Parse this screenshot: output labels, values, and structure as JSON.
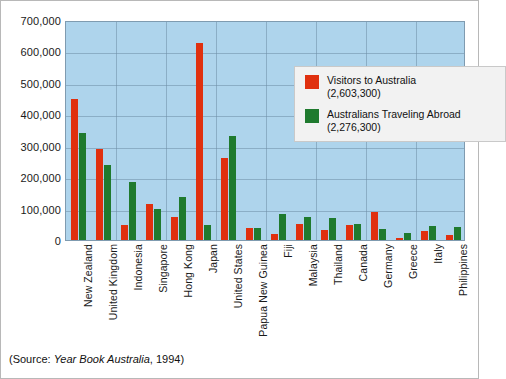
{
  "chart_data": {
    "type": "bar",
    "title": "",
    "xlabel": "",
    "ylabel": "",
    "ylim": [
      0,
      700000
    ],
    "ytick_step": 100000,
    "ytick_labels": [
      "700,000",
      "600,000",
      "500,000",
      "400,000",
      "300,000",
      "200,000",
      "100,000",
      "0"
    ],
    "grid": true,
    "legend_position": "inside-top-right",
    "categories": [
      "New Zealand",
      "United Kingdom",
      "Indonesia",
      "Singapore",
      "Hong Kong",
      "Japan",
      "United States",
      "Papua New Guinea",
      "Fiji",
      "Malaysia",
      "Thailand",
      "Canada",
      "Germany",
      "Greece",
      "Italy",
      "Philippines"
    ],
    "series": [
      {
        "name": "Visitors to Australia",
        "total": "2,603,300",
        "color": "#e0300f",
        "values": [
          449000,
          290000,
          48000,
          115000,
          73000,
          627000,
          262000,
          39000,
          18000,
          51000,
          33000,
          48000,
          90000,
          8000,
          30000,
          17000
        ]
      },
      {
        "name": "Australians Traveling Abroad",
        "total": "2,276,300",
        "color": "#1f7a2e",
        "values": [
          339000,
          240000,
          186000,
          99000,
          136000,
          48000,
          330000,
          37000,
          84000,
          72000,
          70000,
          52000,
          36000,
          21000,
          44000,
          42000
        ]
      }
    ]
  },
  "legend": {
    "entries": [
      {
        "label": "Visitors to Australia",
        "value": "(2,603,300)",
        "swatch": "red"
      },
      {
        "label": "Australians Traveling Abroad",
        "value": "(2,276,300)",
        "swatch": "green"
      }
    ]
  },
  "source": {
    "prefix": "(Source: ",
    "publication": "Year Book Australia",
    "suffix": ", 1994)"
  },
  "colors": {
    "red": "#e0300f",
    "green": "#1f7a2e",
    "plot_background": "#aed4ec",
    "gridline": "#6f8ea8",
    "legend_background": "#f2f2f2"
  }
}
